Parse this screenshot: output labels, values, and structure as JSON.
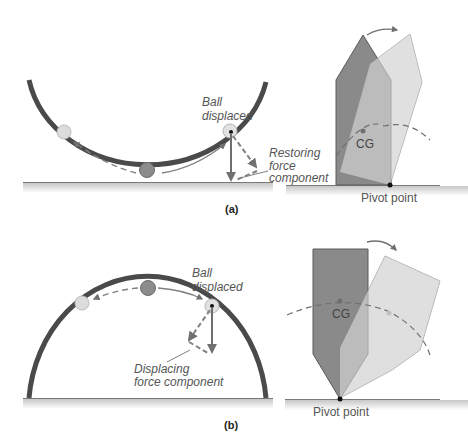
{
  "figure": {
    "panels": [
      {
        "id": "a",
        "label": "(a)",
        "title": "Stable equilibrium",
        "ball_diagram": {
          "surface": "concave bowl",
          "ball_label_line1": "Ball",
          "ball_label_line2": "displaced",
          "force_label_line1": "Restoring",
          "force_label_line2": "force",
          "force_label_line3": "component"
        },
        "block_diagram": {
          "cg_label": "CG",
          "pivot_label": "Pivot point"
        }
      },
      {
        "id": "b",
        "label": "(b)",
        "title": "Unstable equilibrium",
        "ball_diagram": {
          "surface": "convex dome",
          "ball_label_line1": "Ball",
          "ball_label_line2": "displaced",
          "force_label_line1": "Displacing",
          "force_label_line2": "force component"
        },
        "block_diagram": {
          "cg_label": "CG",
          "pivot_label": "Pivot point"
        }
      }
    ],
    "colors": {
      "surface": "#4a4a4a",
      "ground": "#7a7a7a",
      "arrow": "#707070",
      "ball_rest": "#8c8c8c",
      "ball_ghost": "#dcdcdc",
      "block_dark": "#8a8a8a",
      "block_light": "#d8d8d8"
    }
  }
}
